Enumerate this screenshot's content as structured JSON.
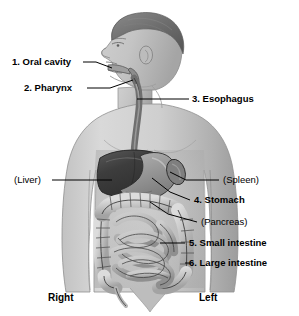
{
  "figure": {
    "background_color": "#ffffff",
    "line_color": "#000000",
    "labels": {
      "oral_cavity": "1. Oral cavity",
      "pharynx": "2. Pharynx",
      "esophagus": "3. Esophagus",
      "liver": "(Liver)",
      "spleen": "(Spleen)",
      "stomach": "4. Stomach",
      "pancreas": "(Pancreas)",
      "small_intestine": "5. Small intestine",
      "large_intestine": "6. Large intestine"
    },
    "orientation": {
      "right": "Right",
      "left": "Left"
    },
    "colors": {
      "body_light": "#d2d2d2",
      "body_mid": "#b6b6b6",
      "body_shadow": "#9a9a9a",
      "hair_dark": "#6f6f6f",
      "liver_dark": "#3f3f3f",
      "stomach_gray": "#9d9d9d",
      "intestine_light": "#c9c9c9",
      "outline": "#2b2b2b"
    }
  }
}
